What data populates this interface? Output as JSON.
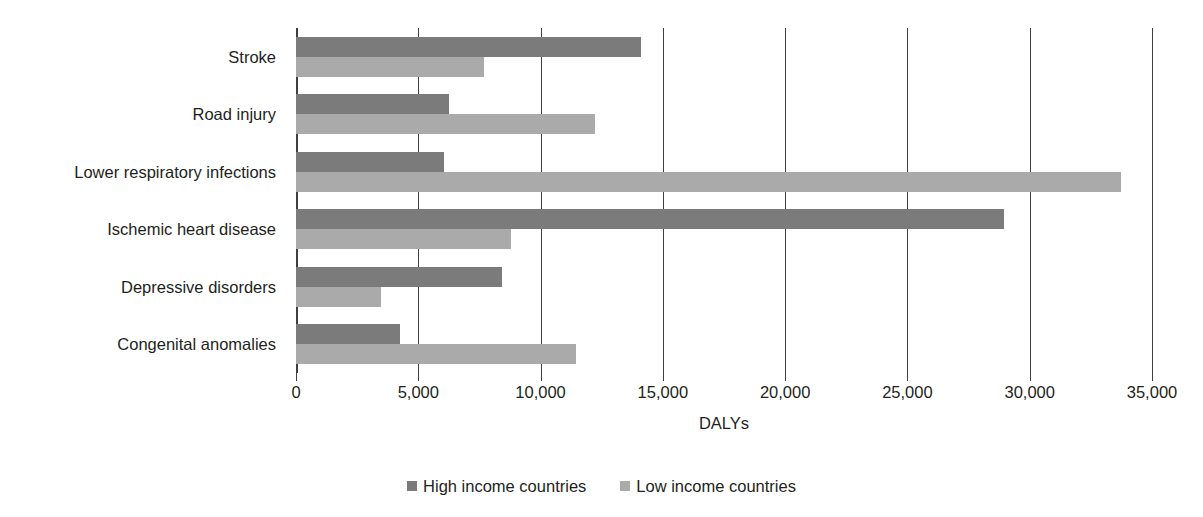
{
  "chart_data": {
    "type": "bar",
    "orientation": "horizontal",
    "title": "",
    "xlabel": "DALYs",
    "ylabel": "",
    "xlim": [
      0,
      35000
    ],
    "xticks": [
      0,
      5000,
      10000,
      15000,
      20000,
      25000,
      30000,
      35000
    ],
    "xtick_labels": [
      "0",
      "5,000",
      "10,000",
      "15,000",
      "20,000",
      "25,000",
      "30,000",
      "35,000"
    ],
    "grid": "vertical",
    "legend_position": "bottom-center",
    "categories": [
      "Stroke",
      "Road injury",
      "Lower respiratory infections",
      "Ischemic heart disease",
      "Depressive disorders",
      "Congenital anomalies"
    ],
    "series": [
      {
        "name": "High income countries",
        "color": "#7b7b7b",
        "values": [
          14100,
          6250,
          6050,
          28950,
          8420,
          4250
        ]
      },
      {
        "name": "Low income countries",
        "color": "#aaaaaa",
        "values": [
          7700,
          12220,
          33730,
          8790,
          3470,
          11450
        ]
      }
    ]
  },
  "legend": {
    "items": [
      {
        "label": "High income countries",
        "color": "#7b7b7b"
      },
      {
        "label": "Low income countries",
        "color": "#aaaaaa"
      }
    ]
  }
}
